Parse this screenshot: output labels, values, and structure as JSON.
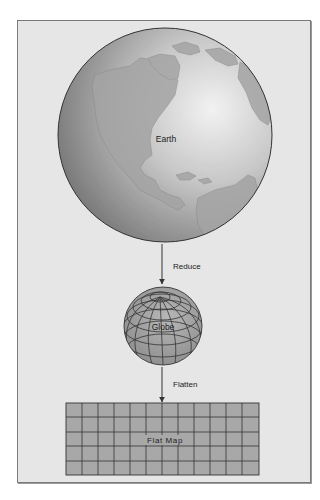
{
  "diagram": {
    "earth_label": "Earth",
    "reduce_label": "Reduce",
    "globe_label": "Globe",
    "flatten_label": "Flatten",
    "flat_map_label": "Flat Map",
    "flat_map_grid": {
      "columns": 12,
      "rows": 5
    },
    "colors": {
      "background": "#e6e6e6",
      "frame": "#7a7a7a",
      "sphere_dark": "#7d7d7d",
      "sphere_light": "#e8e8e8",
      "land": "#a9a9a9",
      "grid_fill": "#a8a8a8",
      "line": "#333333"
    }
  }
}
